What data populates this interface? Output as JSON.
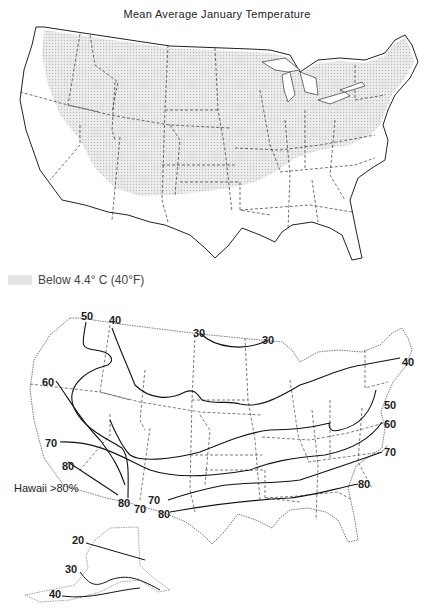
{
  "figure": {
    "title": "Mean Average January Temperature",
    "top_map": {
      "legend": {
        "swatch_color": "#e3e3e3",
        "label": "Below 4.4° C (40°F)"
      }
    },
    "bottom_map": {
      "isoline_labels": [
        {
          "id": "wa-50",
          "text": "50",
          "x": 81,
          "y": 313
        },
        {
          "id": "id-40",
          "text": "40",
          "x": 109,
          "y": 320
        },
        {
          "id": "nd-30",
          "text": "30",
          "x": 193,
          "y": 331
        },
        {
          "id": "mn-30",
          "text": "30",
          "x": 262,
          "y": 338
        },
        {
          "id": "ne-40",
          "text": "40",
          "x": 402,
          "y": 358
        },
        {
          "id": "or-60",
          "text": "60",
          "x": 42,
          "y": 379
        },
        {
          "id": "nj-50",
          "text": "50",
          "x": 383,
          "y": 403
        },
        {
          "id": "va-60",
          "text": "60",
          "x": 385,
          "y": 423
        },
        {
          "id": "nc-70",
          "text": "70",
          "x": 385,
          "y": 451
        },
        {
          "id": "ca-70",
          "text": "70",
          "x": 45,
          "y": 441
        },
        {
          "id": "ca-80",
          "text": "80",
          "x": 62,
          "y": 464
        },
        {
          "id": "sc-80",
          "text": "80",
          "x": 358,
          "y": 482
        },
        {
          "id": "az-80",
          "text": "80",
          "x": 118,
          "y": 500
        },
        {
          "id": "az-70",
          "text": "70",
          "x": 134,
          "y": 505
        },
        {
          "id": "nm-70",
          "text": "70",
          "x": 148,
          "y": 496
        },
        {
          "id": "tx-80",
          "text": "80",
          "x": 158,
          "y": 511
        }
      ],
      "hawaii_note": "Hawaii >80%",
      "alaska_labels": [
        {
          "id": "ak-20",
          "text": "20",
          "x": 72,
          "y": 538
        },
        {
          "id": "ak-30",
          "text": "30",
          "x": 65,
          "y": 567
        },
        {
          "id": "ak-40",
          "text": "40",
          "x": 49,
          "y": 592
        }
      ]
    }
  }
}
